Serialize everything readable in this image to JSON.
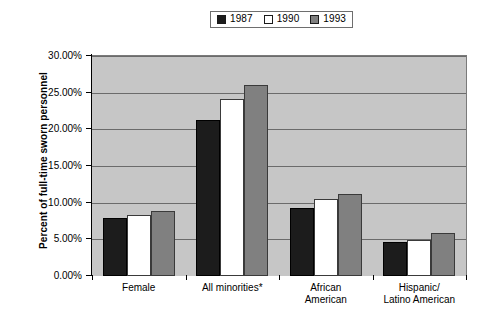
{
  "chart_data": {
    "type": "bar",
    "title": "",
    "xlabel": "",
    "ylabel": "Percent of full-time sworn personnel",
    "ylim": [
      0,
      30
    ],
    "ytick_labels": [
      "0.00%",
      "5.00%",
      "10.00%",
      "15.00%",
      "20.00%",
      "25.00%",
      "30.00%"
    ],
    "ytick_values": [
      0,
      5,
      10,
      15,
      20,
      25,
      30
    ],
    "grid": true,
    "legend_position": "top-center",
    "categories": [
      "Female",
      "All minorities*",
      "African American",
      "Hispanic/ Latino American"
    ],
    "category_lines": [
      [
        "Female"
      ],
      [
        "All minorities*"
      ],
      [
        "African",
        "American"
      ],
      [
        "Hispanic/",
        "Latino American"
      ]
    ],
    "series": [
      {
        "name": "1987",
        "color": "#1c1c1c",
        "values": [
          7.9,
          21.3,
          9.3,
          4.6
        ]
      },
      {
        "name": "1990",
        "color": "#ffffff",
        "values": [
          8.3,
          24.2,
          10.5,
          4.9
        ]
      },
      {
        "name": "1993",
        "color": "#808080",
        "values": [
          8.8,
          26.1,
          11.2,
          5.9
        ]
      }
    ]
  },
  "legend": {
    "items": [
      {
        "label": "1987"
      },
      {
        "label": "1990"
      },
      {
        "label": "1993"
      }
    ]
  },
  "axis": {
    "y_title": "Percent of full-time sworn personnel"
  },
  "colors": {
    "plot_background": "#c6c6c6",
    "gridline": "#6b6b6b",
    "page_background": "#ffffff",
    "series_1987": "#1c1c1c",
    "series_1990": "#ffffff",
    "series_1993": "#808080"
  }
}
